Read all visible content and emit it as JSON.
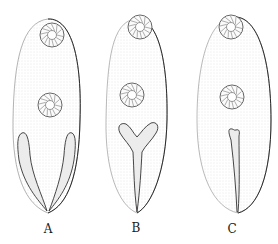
{
  "figure": {
    "colors": {
      "outline": "#2a2a2a",
      "stipple": "#bdbdbd",
      "fill": "#f4f4f4",
      "background": "#ffffff"
    },
    "specimens": [
      {
        "label": "A",
        "structure": "paired-lobes",
        "label_x": 48,
        "label_y": 223
      },
      {
        "label": "B",
        "structure": "y-shaped-stalk",
        "label_x": 136,
        "label_y": 222
      },
      {
        "label": "C",
        "structure": "single-strand",
        "label_x": 232,
        "label_y": 223
      }
    ]
  }
}
